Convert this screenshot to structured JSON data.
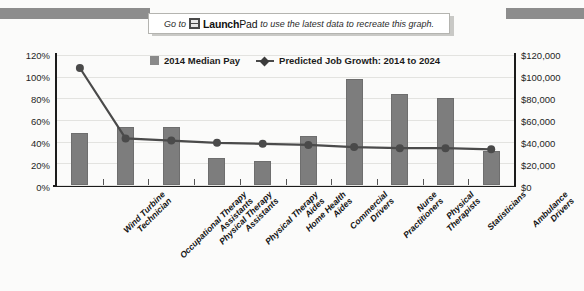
{
  "banner": {
    "prefix": "Go to",
    "icon": "launchpad-image-icon",
    "brand_bold": "Launch",
    "brand_light": "Pad",
    "suffix": "to use the latest data to recreate this graph."
  },
  "legend": [
    {
      "label": "2014 Median Pay",
      "marker": "square",
      "color": "#8a8a8a"
    },
    {
      "label": "Predicted Job Growth: 2014 to 2024",
      "marker": "diamond-line",
      "color": "#4a4a4a"
    }
  ],
  "axes": {
    "left_ticks": [
      "0%",
      "20%",
      "40%",
      "60%",
      "80%",
      "100%",
      "120%"
    ],
    "right_ticks": [
      "$0",
      "$20,000",
      "$40,000",
      "$60,000",
      "$80,000",
      "$100,000",
      "$120,000"
    ]
  },
  "chart_data": {
    "type": "bar",
    "title": "",
    "subtitle": "",
    "xlabel": "",
    "ylabel": "",
    "y2label": "",
    "grid": true,
    "legend_position": "top-center",
    "categories": [
      "Wind Turbine Technician",
      "Occupational Therapy Assistants",
      "Physical Therapy Assistants",
      "Physical Therapy Aides",
      "Home Health Aides",
      "Commercial Drivers",
      "Nurse Practitioners",
      "Physical Therapists",
      "Statisticians",
      "Ambulance Drivers"
    ],
    "series": [
      {
        "name": "2014 Median Pay",
        "type": "bar",
        "axis": "right",
        "unit": "USD",
        "values": [
          48000,
          54000,
          54000,
          25000,
          22000,
          45000,
          98000,
          84000,
          80000,
          31000
        ]
      },
      {
        "name": "Predicted Job Growth: 2014 to 2024",
        "type": "line",
        "axis": "left",
        "unit": "percent",
        "values": [
          108,
          43,
          41,
          39,
          38,
          37,
          35,
          34,
          34,
          33
        ]
      }
    ],
    "ylim": [
      0,
      120
    ],
    "y2lim": [
      0,
      120000
    ],
    "ytick_step": 20,
    "y2tick_step": 20000
  },
  "colors": {
    "bar": "#7d7d7d",
    "line": "#4a4a4a",
    "axis": "#1b1b1b",
    "grid": "#e3e3e0",
    "background": "#fbfbfa",
    "ribbon": "#8d8d8d"
  }
}
